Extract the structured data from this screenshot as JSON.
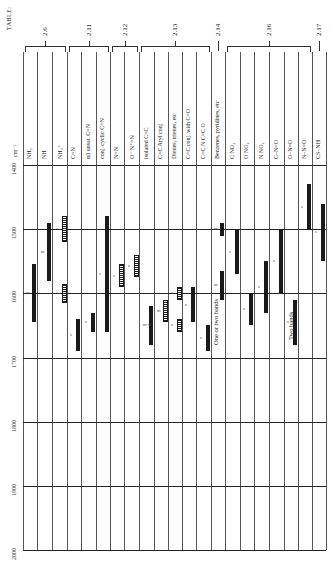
{
  "table_label": "TABLE:",
  "axis_unit": "cm⁻¹",
  "groups": [
    {
      "label": "2.6",
      "x1": 23,
      "x2": 67
    },
    {
      "label": "2.11",
      "x1": 67,
      "x2": 110
    },
    {
      "label": "2.12",
      "x1": 110,
      "x2": 139
    },
    {
      "label": "2.13",
      "x1": 139,
      "x2": 211
    },
    {
      "label": "2.14",
      "x1": 211,
      "x2": 225
    },
    {
      "label": "2.16",
      "x1": 225,
      "x2": 312
    },
    {
      "label": "2.17",
      "x1": 312,
      "x2": 326
    }
  ],
  "columns": [
    "NH₂",
    "NH",
    "NH₃⁺",
    "C=N",
    "αβ unsat.  C=N",
    "conj. cyclic  C=N",
    "N=N",
    "O⁻ N⁺=N",
    "isolated  C=C",
    "C=C  Aryl conj",
    "Dienes, trienes, etc",
    "C=C  conj. with C=O",
    "C=C  N  C=C  O",
    "Benzenes, pyridines, etc",
    "C  NO₂",
    "O  NO₂",
    "N  NO₂",
    "C–N=O",
    "O–N=O",
    "N–N=O",
    "CS–NH"
  ],
  "notes": {
    "benzenes": "One or two bands",
    "o_n_o": "Two bands"
  },
  "chart_data": {
    "type": "range-bar (IR correlation table, rotated)",
    "title": "TABLE:",
    "xlabel": "",
    "ylabel": "cm⁻¹",
    "ylim": [
      1400,
      2000
    ],
    "yticks": [
      1400,
      1500,
      1600,
      1700,
      1800,
      1900,
      2000
    ],
    "grid": true,
    "categories": [
      "NH2",
      "NH",
      "NH3+",
      "C=N",
      "alpha,beta-unsat. C=N",
      "conj. cyclic C=N",
      "N=N",
      "O- N+=N",
      "isolated C=C",
      "C=C Aryl conj",
      "Dienes, trienes, etc",
      "C=C conj. with C=O",
      "C=C N C=C O",
      "Benzenes, pyridines, etc",
      "C-NO2",
      "O-NO2",
      "N-NO2",
      "C-N=O",
      "O-N=O",
      "N-N=O",
      "CS-NH"
    ],
    "bands": [
      {
        "col": 0,
        "from": 1555,
        "to": 1645,
        "style": "solid",
        "intensity": "m"
      },
      {
        "col": 1,
        "from": 1490,
        "to": 1580,
        "style": "solid",
        "intensity": "m"
      },
      {
        "col": 2,
        "from": 1480,
        "to": 1520,
        "style": "hatched",
        "intensity": "s"
      },
      {
        "col": 2,
        "from": 1585,
        "to": 1615,
        "style": "hatched",
        "intensity": "s"
      },
      {
        "col": 3,
        "from": 1640,
        "to": 1690,
        "style": "solid",
        "intensity": "s"
      },
      {
        "col": 4,
        "from": 1630,
        "to": 1660,
        "style": "solid",
        "intensity": "s"
      },
      {
        "col": 5,
        "from": 1480,
        "to": 1660,
        "style": "solid",
        "intensity": "s"
      },
      {
        "col": 6,
        "from": 1555,
        "to": 1590,
        "style": "hatched",
        "intensity": "s"
      },
      {
        "col": 7,
        "from": 1540,
        "to": 1575,
        "style": "hatched",
        "intensity": "s"
      },
      {
        "col": 8,
        "from": 1620,
        "to": 1680,
        "style": "solid",
        "intensity": "m-w"
      },
      {
        "col": 9,
        "from": 1610,
        "to": 1645,
        "style": "hatched",
        "intensity": "m"
      },
      {
        "col": 10,
        "from": 1590,
        "to": 1610,
        "style": "hatched",
        "intensity": "s"
      },
      {
        "col": 10,
        "from": 1640,
        "to": 1660,
        "style": "hatched",
        "intensity": "s"
      },
      {
        "col": 11,
        "from": 1590,
        "to": 1645,
        "style": "solid",
        "intensity": "s"
      },
      {
        "col": 12,
        "from": 1650,
        "to": 1690,
        "style": "solid",
        "intensity": "s"
      },
      {
        "col": 13,
        "from": 1490,
        "to": 1510,
        "style": "solid",
        "intensity": "m"
      },
      {
        "col": 13,
        "from": 1565,
        "to": 1610,
        "style": "solid",
        "intensity": "m"
      },
      {
        "col": 14,
        "from": 1500,
        "to": 1570,
        "style": "solid",
        "intensity": "s"
      },
      {
        "col": 15,
        "from": 1600,
        "to": 1650,
        "style": "solid",
        "intensity": "s"
      },
      {
        "col": 16,
        "from": 1550,
        "to": 1630,
        "style": "solid",
        "intensity": "s"
      },
      {
        "col": 17,
        "from": 1500,
        "to": 1600,
        "style": "solid",
        "intensity": "s"
      },
      {
        "col": 18,
        "from": 1610,
        "to": 1680,
        "style": "solid",
        "intensity": "s"
      },
      {
        "col": 19,
        "from": 1430,
        "to": 1500,
        "style": "solid",
        "intensity": "s"
      },
      {
        "col": 20,
        "from": 1460,
        "to": 1550,
        "style": "solid",
        "intensity": "s"
      }
    ],
    "annotations": [
      "One or two bands",
      "Two bands"
    ]
  }
}
